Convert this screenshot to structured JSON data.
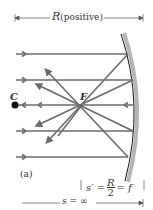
{
  "figure": {
    "top_dimension": {
      "symbol": "R",
      "text": "(positive)"
    },
    "center_label": "C",
    "focal_label": "F",
    "panel_label": "(a)",
    "image_distance": {
      "lhs": "s′ =",
      "num": "R",
      "den": "2",
      "rhs": "= f"
    },
    "object_distance": "s = ∞",
    "colors": {
      "ray": "#6b6b6b",
      "mirror_line": "#111111",
      "mirror_band": "#b5b5b5",
      "text": "#333333"
    }
  }
}
